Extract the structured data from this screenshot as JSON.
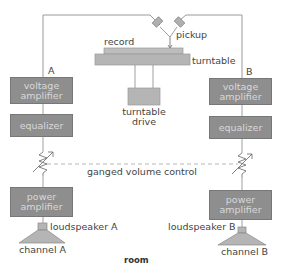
{
  "diagram": {
    "channels": {
      "a": {
        "label": "A",
        "voltage_amplifier": [
          "voltage",
          "amplifier"
        ],
        "equalizer": "equalizer",
        "power_amplifier": [
          "power",
          "amplifier"
        ],
        "loudspeaker": "loudspeaker A",
        "channel": "channel A"
      },
      "b": {
        "label": "B",
        "voltage_amplifier": [
          "voltage",
          "amplifier"
        ],
        "equalizer": "equalizer",
        "power_amplifier": [
          "power",
          "amplifier"
        ],
        "loudspeaker": "loudspeaker B",
        "channel": "channel B"
      }
    },
    "source": {
      "record": "record",
      "pickup": "pickup",
      "turntable": "turntable",
      "turntable_drive": [
        "turntable",
        "drive"
      ]
    },
    "ganged_volume_control": "ganged volume control",
    "room": "room",
    "colors": {
      "box_fill": "#8e8e8e",
      "box_text": "#d9d9d9",
      "turntable_fill": "#b5b5b5",
      "line": "#888888"
    }
  }
}
